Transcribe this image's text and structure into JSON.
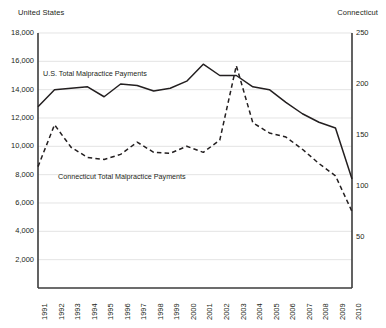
{
  "axis_titles": {
    "left": "United States",
    "right": "Connecticut"
  },
  "series_labels": {
    "us": "U.S. Total Malpractice Payments",
    "ct": "Connecticut Total Malpractice Payments"
  },
  "chart_data": {
    "type": "line",
    "title": "",
    "xlabel": "",
    "ylabel": "United States",
    "y2label": "Connecticut",
    "grid": true,
    "legend": "inline-annotation",
    "categories": [
      "1991",
      "1992",
      "1993",
      "1994",
      "1995",
      "1996",
      "1997",
      "1998",
      "1999",
      "2000",
      "2001",
      "2002",
      "2003",
      "2004",
      "2005",
      "2006",
      "2007",
      "2008",
      "2009",
      "2010"
    ],
    "left_axis": {
      "label": "United States",
      "ticks": [
        "2,000",
        "4,000",
        "6,000",
        "8,000",
        "10,000",
        "12,000",
        "14,000",
        "16,000",
        "18,000"
      ],
      "tick_values": [
        2000,
        4000,
        6000,
        8000,
        10000,
        12000,
        14000,
        16000,
        18000
      ],
      "ylim": [
        0,
        18000
      ]
    },
    "right_axis": {
      "label": "Connecticut",
      "ticks": [
        "50",
        "100",
        "150",
        "200",
        "250"
      ],
      "tick_values": [
        50,
        100,
        150,
        200,
        250
      ],
      "ylim": [
        0,
        250
      ]
    },
    "series": [
      {
        "name": "U.S. Total Malpractice Payments",
        "axis": "left",
        "style": "solid",
        "color": "#231f20",
        "values": [
          12800,
          14000,
          14100,
          14200,
          13500,
          14400,
          14300,
          13900,
          14100,
          14600,
          15800,
          15000,
          15000,
          14200,
          14000,
          13100,
          12300,
          11700,
          11300,
          7700
        ]
      },
      {
        "name": "Connecticut Total Malpractice Payments",
        "axis": "right",
        "style": "dashed",
        "color": "#231f20",
        "values": [
          119,
          160,
          138,
          128,
          126,
          131,
          143,
          133,
          132,
          139,
          133,
          145,
          218,
          162,
          152,
          148,
          136,
          122,
          110,
          75
        ]
      }
    ]
  }
}
